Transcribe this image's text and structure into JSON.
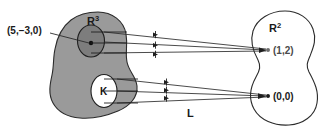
{
  "figure": {
    "kind": "set-mapping-diagram",
    "background_color": "#ffffff"
  },
  "domain_set": {
    "name_base": "R",
    "name_exponent": "3",
    "fill_color": "#9a9a9a",
    "stroke_color": "#2b2b2b"
  },
  "codomain_set": {
    "name_base": "R",
    "name_exponent": "2",
    "fill_color": "#ffffff",
    "stroke_color": "#2b2b2b"
  },
  "preimage_upper": {
    "label": "(5,−3,0)",
    "fill_color": "#7d7d7d",
    "stroke_color": "#1f1f1f",
    "point_color": "#111111"
  },
  "kernel": {
    "label": "K",
    "fill_color": "#ffffff",
    "stroke_color": "#1f1f1f"
  },
  "image_points": [
    {
      "label": "(1,2)",
      "color": "#6e6e6e",
      "dot_color": "#6e6e6e"
    },
    {
      "label": "(0,0)",
      "color": "#1a1a1a",
      "dot_color": "#1a1a1a"
    }
  ],
  "mapping": {
    "label": "L",
    "arrow_color": "#2b2b2b",
    "upper_bundle_count": 3,
    "lower_bundle_count": 3
  }
}
